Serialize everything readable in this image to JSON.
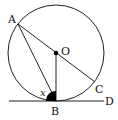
{
  "diagram": {
    "type": "geometry",
    "colors": {
      "stroke": "#222222",
      "fill_angle": "#000000",
      "background": "#ffffff"
    },
    "circle": {
      "center_label": "O",
      "cx": 56,
      "cy": 53,
      "r": 48
    },
    "points": [
      {
        "label": "A",
        "x": 18,
        "y": 24
      },
      {
        "label": "O",
        "x": 56,
        "y": 53
      },
      {
        "label": "B",
        "x": 56,
        "y": 101
      },
      {
        "label": "C",
        "x": 95,
        "y": 82
      },
      {
        "label": "D",
        "x": 104,
        "y": 101
      }
    ],
    "segments": [
      "AC",
      "AB",
      "OB",
      "BD (tangent line)"
    ],
    "angle_label": "x",
    "labels": {
      "A": "A",
      "O": "O",
      "B": "B",
      "C": "C",
      "D": "D",
      "x": "x"
    }
  }
}
